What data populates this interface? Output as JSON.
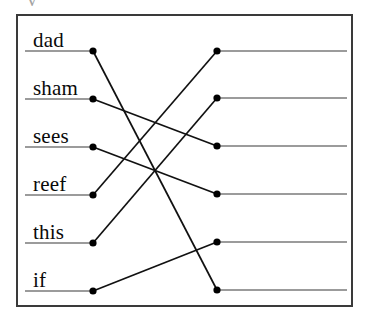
{
  "figure": {
    "name": "word-matching-diagram",
    "partial_top_text": "v",
    "frame": {
      "x": 16,
      "y": 14,
      "width": 337,
      "height": 293,
      "border_color": "#3a3a3a",
      "border_width": 2,
      "background": "#ffffff"
    },
    "colors": {
      "rule_line": "#7a7a7a",
      "connector_line": "#111111",
      "dot": "#000000",
      "text": "#0a0a0a"
    },
    "left_column": {
      "label_x": 33,
      "rule_x_start": 25,
      "dot_x": 93,
      "items": [
        {
          "label": "dad",
          "y": 51,
          "dot_name": "left-dot-dad"
        },
        {
          "label": "sham",
          "y": 99,
          "dot_name": "left-dot-sham"
        },
        {
          "label": "sees",
          "y": 147,
          "dot_name": "left-dot-sees"
        },
        {
          "label": "reef",
          "y": 195,
          "dot_name": "left-dot-reef"
        },
        {
          "label": "this",
          "y": 243,
          "dot_name": "left-dot-this"
        },
        {
          "label": "if",
          "y": 291,
          "dot_name": "left-dot-if"
        }
      ]
    },
    "right_column": {
      "dot_x": 217,
      "rule_x_end": 347,
      "items": [
        {
          "label": "",
          "y": 51,
          "dot_name": "right-dot-1"
        },
        {
          "label": "",
          "y": 98,
          "dot_name": "right-dot-2"
        },
        {
          "label": "",
          "y": 146,
          "dot_name": "right-dot-3"
        },
        {
          "label": "",
          "y": 194,
          "dot_name": "right-dot-4"
        },
        {
          "label": "",
          "y": 242,
          "dot_name": "right-dot-5"
        },
        {
          "label": "",
          "y": 290,
          "dot_name": "right-dot-6"
        }
      ]
    },
    "connections": [
      {
        "from": "dad",
        "to": "right-dot-6",
        "x1": 93,
        "y1": 51,
        "x2": 217,
        "y2": 290
      },
      {
        "from": "sham",
        "to": "right-dot-3",
        "x1": 93,
        "y1": 99,
        "x2": 217,
        "y2": 146
      },
      {
        "from": "sees",
        "to": "right-dot-4",
        "x1": 93,
        "y1": 147,
        "x2": 217,
        "y2": 194
      },
      {
        "from": "reef",
        "to": "right-dot-1",
        "x1": 93,
        "y1": 195,
        "x2": 217,
        "y2": 51
      },
      {
        "from": "this",
        "to": "right-dot-2",
        "x1": 93,
        "y1": 243,
        "x2": 217,
        "y2": 98
      },
      {
        "from": "if",
        "to": "right-dot-5",
        "x1": 93,
        "y1": 291,
        "x2": 217,
        "y2": 242
      }
    ]
  }
}
